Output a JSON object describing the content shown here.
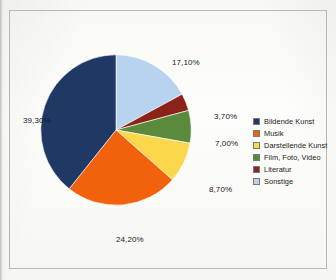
{
  "chart_data": {
    "type": "pie",
    "title": "",
    "subtitle": "",
    "xlabel": "",
    "ylabel": "",
    "legend_position": "right",
    "grid": false,
    "value_suffix": "%",
    "decimal_separator": ",",
    "categories": [
      "Bildende Kunst",
      "Musik",
      "Darstellende Kunst",
      "Film, Foto, Video",
      "Literatur",
      "Sonstige"
    ],
    "values": [
      39.3,
      24.2,
      8.7,
      7.0,
      3.7,
      17.1
    ],
    "colors": [
      "#1f3864",
      "#f2610c",
      "#fad74b",
      "#5b8a3c",
      "#8c2318",
      "#b8d3f0"
    ],
    "slices": [
      {
        "name": "Sonstige",
        "value": 17.1,
        "label": "17,10%",
        "color": "#b8d3f0",
        "draw_order": 1
      },
      {
        "name": "Literatur",
        "value": 3.7,
        "label": "3,70%",
        "color": "#8c2318",
        "draw_order": 2
      },
      {
        "name": "Film, Foto, Video",
        "value": 7.0,
        "label": "7,00%",
        "color": "#5b8a3c",
        "draw_order": 3
      },
      {
        "name": "Darstellende Kunst",
        "value": 8.7,
        "label": "8,70%",
        "color": "#fad74b",
        "draw_order": 4
      },
      {
        "name": "Musik",
        "value": 24.2,
        "label": "24,20%",
        "color": "#f2610c",
        "draw_order": 5
      },
      {
        "name": "Bildende Kunst",
        "value": 39.3,
        "label": "39,30%",
        "color": "#1f3864",
        "draw_order": 6
      }
    ],
    "legend": [
      {
        "label": "Bildende Kunst",
        "color": "#1f3864"
      },
      {
        "label": "Musik",
        "color": "#f2610c"
      },
      {
        "label": "Darstellende Kunst",
        "color": "#fad74b"
      },
      {
        "label": "Film, Foto, Video",
        "color": "#5b8a3c"
      },
      {
        "label": "Literatur",
        "color": "#8c2318"
      },
      {
        "label": "Sonstige",
        "color": "#b8d3f0"
      }
    ]
  }
}
